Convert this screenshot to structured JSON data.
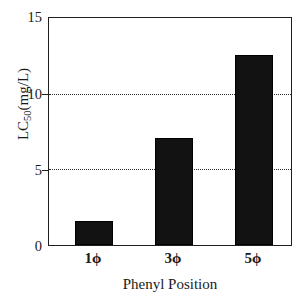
{
  "chart_data": {
    "type": "bar",
    "title": "",
    "categories": [
      "1ϕ",
      "3ϕ",
      "5ϕ"
    ],
    "values": [
      1.6,
      7.1,
      12.55
    ],
    "xlabel": "Phenyl Position",
    "ylabel": "LC50(mg/L)",
    "ylabel_base": "LC",
    "ylabel_sub": "50",
    "ylabel_tail": "(mg/L)",
    "ylim": [
      0,
      15
    ],
    "yticks": [
      0,
      5,
      10,
      15
    ],
    "ytick_labels": [
      "0",
      "5",
      "10",
      "15"
    ],
    "gridlines": [
      5,
      10
    ],
    "grid": "horizontal-dotted",
    "legend": "none",
    "bar_color": "#121212",
    "background_color": "#ffffff",
    "axis_color": "#1f1f1f"
  },
  "axes": {
    "y_title_full": "LC50(mg/L)",
    "x_title": "Phenyl Position"
  }
}
